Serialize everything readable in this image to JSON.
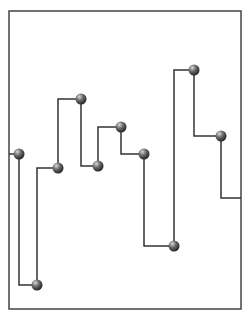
{
  "chart_data": {
    "type": "line",
    "subtype": "step",
    "title": "",
    "xlabel": "",
    "ylabel": "",
    "grid": false,
    "legend": null,
    "frame": {
      "left": 9,
      "top": 11,
      "right": 241,
      "bottom": 309
    },
    "line_color": "#333333",
    "marker_color": "#555555",
    "x": [
      1,
      2,
      3,
      4,
      5,
      6,
      7,
      8,
      9,
      10
    ],
    "values": [
      0.52,
      0.08,
      0.47,
      0.71,
      0.48,
      0.61,
      0.52,
      0.21,
      0.8,
      0.58
    ],
    "end_value": 0.37,
    "points_px": [
      [
        19,
        154
      ],
      [
        37,
        285
      ],
      [
        58,
        168
      ],
      [
        81,
        99
      ],
      [
        98,
        166
      ],
      [
        121,
        127
      ],
      [
        144,
        154
      ],
      [
        174,
        246
      ],
      [
        194,
        70
      ],
      [
        221,
        136
      ]
    ],
    "start_px": [
      9,
      154
    ],
    "end_px": [
      241,
      198
    ]
  }
}
